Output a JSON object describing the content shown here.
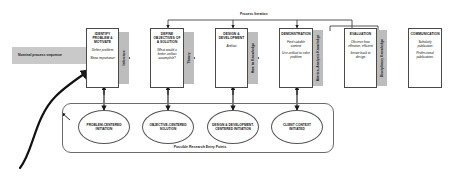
{
  "diagram": {
    "iteration_label": "Process Iteration",
    "nominal_sequence_label": "Nominal process sequence",
    "entry_points_label": "Possible Research Entry Points",
    "colors": {
      "band_fill": "#bdbdbd",
      "nominal_fill": "#c9c9c9",
      "box_stroke": "#4a4a4a",
      "ellipse_stroke": "#555555",
      "arrow": "#1a1a1a",
      "background": "#ffffff"
    }
  },
  "steps": [
    {
      "id": "identify-problem",
      "header": "Identify Problem & Motivate",
      "lines": [
        "Define problem",
        "Show importance"
      ]
    },
    {
      "id": "define-objectives",
      "header": "Define Objectives of a Solution",
      "lines": [
        "What would a better artifact accomplish?"
      ]
    },
    {
      "id": "design-development",
      "header": "Design & Development",
      "lines": [
        "Artifact"
      ]
    },
    {
      "id": "demonstration",
      "header": "Demonstration",
      "lines": [
        "Find suitable context",
        "Use artifact to solve problem"
      ]
    },
    {
      "id": "evaluation",
      "header": "Evaluation",
      "lines": [
        "Observe how effective, efficient",
        "Iterate back to design"
      ]
    },
    {
      "id": "communication",
      "header": "Communication",
      "lines": [
        "Scholarly publication",
        "Professional publications"
      ]
    }
  ],
  "bands": [
    {
      "id": "inference",
      "label": "Inference"
    },
    {
      "id": "theory",
      "label": "Theory"
    },
    {
      "id": "how-to-knowledge",
      "label": "How to Knowledge"
    },
    {
      "id": "metrics-analysis-knowledge",
      "label": "Metrics, Analysis Knowledge"
    },
    {
      "id": "disciplinary-knowledge",
      "label": "Disciplinary Knowledge"
    }
  ],
  "entry_points": [
    {
      "id": "problem-centered",
      "label": "Problem-Centered Initiation"
    },
    {
      "id": "objective-centered",
      "label": "Objective-Centered Solution"
    },
    {
      "id": "design-development-centered",
      "label": "Design & Development-Centered Initiation"
    },
    {
      "id": "client-context",
      "label": "Client Context Initiated"
    }
  ]
}
